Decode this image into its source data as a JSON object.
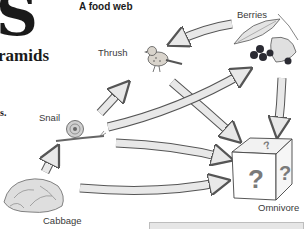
{
  "page": {
    "heading_fragment": "S",
    "subheading_fragment": "ramids",
    "body_fragment": "s."
  },
  "diagram": {
    "title": "A food web",
    "organisms": [
      {
        "id": "berries",
        "label": "Berries",
        "role": "producer",
        "icon": "berries-icon"
      },
      {
        "id": "thrush",
        "label": "Thrush",
        "role": "consumer",
        "icon": "bird-icon"
      },
      {
        "id": "snail",
        "label": "Snail",
        "role": "consumer",
        "icon": "snail-icon"
      },
      {
        "id": "cabbage",
        "label": "Cabbage",
        "role": "producer",
        "icon": "cabbage-icon"
      },
      {
        "id": "omnivore",
        "label": "Omnivore",
        "role": "unknown consumer",
        "icon": "mystery-box-icon",
        "box_glyph": "?"
      }
    ],
    "arrows": [
      {
        "from": "berries",
        "to": "thrush"
      },
      {
        "from": "snail",
        "to": "thrush"
      },
      {
        "from": "cabbage",
        "to": "snail"
      },
      {
        "from": "snail",
        "to": "berries"
      },
      {
        "from": "thrush",
        "to": "omnivore"
      },
      {
        "from": "berries",
        "to": "omnivore"
      },
      {
        "from": "snail",
        "to": "omnivore"
      },
      {
        "from": "cabbage",
        "to": "omnivore"
      }
    ],
    "colors": {
      "arrow_fill": "#e8e8e8",
      "arrow_stroke": "#555555",
      "berry": "#2b2b33",
      "question_mark": "#7a7a7a"
    }
  }
}
